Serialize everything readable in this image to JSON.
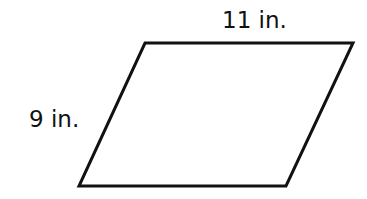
{
  "figure": {
    "shape": "parallelogram",
    "vertices": {
      "top_left": [
        145,
        43
      ],
      "top_right": [
        353,
        43
      ],
      "bottom_right": [
        286,
        186
      ],
      "bottom_left": [
        79,
        186
      ]
    },
    "stroke_color": "#111111",
    "fill_color": "#ffffff",
    "labels": {
      "top_side": "11 in.",
      "left_side": "9 in."
    }
  }
}
